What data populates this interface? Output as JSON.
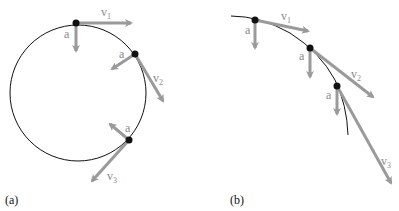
{
  "colors": {
    "path": "#111111",
    "vector": "#9a9a9a",
    "point": "#111111",
    "label": "#8a8a8a"
  },
  "panels": [
    {
      "id": "a",
      "label": "(a)",
      "description": "Uniform circular motion: constant speed, acceleration toward center",
      "points": [
        {
          "velocity_label": "v",
          "velocity_sub": "1",
          "accel_label": "a"
        },
        {
          "velocity_label": "v",
          "velocity_sub": "2",
          "accel_label": "a"
        },
        {
          "velocity_label": "v",
          "velocity_sub": "3",
          "accel_label": "a"
        }
      ]
    },
    {
      "id": "b",
      "label": "(b)",
      "description": "Projectile motion: constant downward acceleration, growing speed",
      "points": [
        {
          "velocity_label": "v",
          "velocity_sub": "1",
          "accel_label": "a"
        },
        {
          "velocity_label": "v",
          "velocity_sub": "2",
          "accel_label": "a"
        },
        {
          "velocity_label": "v",
          "velocity_sub": "3",
          "accel_label": "a"
        }
      ]
    }
  ]
}
